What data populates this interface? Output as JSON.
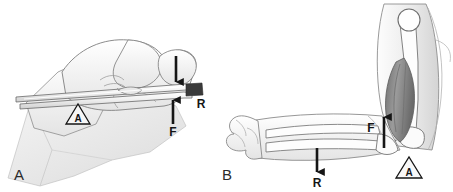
{
  "figure": {
    "background_color": "#ffffff",
    "ink_color": "#151515",
    "line_color": "#6d6d6d",
    "skin_fill": "#fbfbfb",
    "drape_fill": "#ededed",
    "muscle_fill": "#8f8f8f",
    "bone_fill": "#fcfcfc",
    "tip_fill": "#3a3a3a"
  },
  "panels": [
    {
      "id": "panel-a",
      "letter": "A",
      "caption": "Hand gripping forceps",
      "labels": {
        "axis": "A",
        "force": "F",
        "resistance": "R"
      },
      "arrows": [
        {
          "name": "applied-load-arrow",
          "direction": "down",
          "label": ""
        },
        {
          "name": "force-arrow",
          "direction": "up",
          "label": "F"
        }
      ]
    },
    {
      "id": "panel-b",
      "letter": "B",
      "caption": "Flexed elbow with biceps brachii",
      "labels": {
        "axis": "A",
        "force": "F",
        "resistance": "R"
      },
      "arrows": [
        {
          "name": "resistance-arrow",
          "direction": "down",
          "label": "R"
        },
        {
          "name": "force-arrow",
          "direction": "up",
          "label": "F"
        }
      ]
    }
  ],
  "legend": {
    "axis_meaning": "A",
    "force_meaning": "F",
    "resistance_meaning": "R"
  }
}
